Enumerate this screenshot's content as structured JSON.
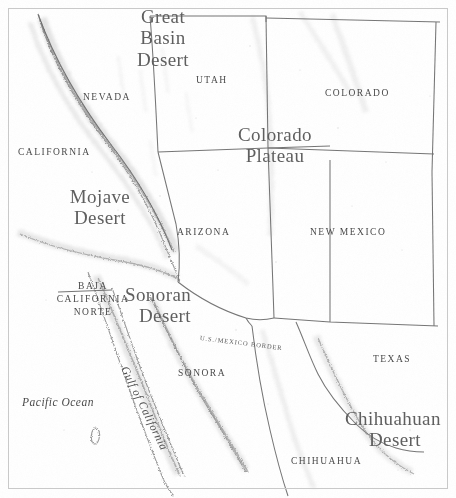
{
  "map": {
    "title": "Deserts of the North American Southwest",
    "style": "pencil-shaded relief map",
    "frame_color": "#c9c9c9",
    "ink_color": "#4a4a4a",
    "background_color": "#fefefe",
    "width": 456,
    "height": 498
  },
  "regions": [
    {
      "id": "great-basin-desert",
      "name": "Great Basin Desert",
      "lines": [
        "Great",
        "Basin",
        "Desert"
      ]
    },
    {
      "id": "colorado-plateau",
      "name": "Colorado Plateau",
      "lines": [
        "Colorado",
        "Plateau"
      ]
    },
    {
      "id": "mojave-desert",
      "name": "Mojave Desert",
      "lines": [
        "Mojave",
        "Desert"
      ]
    },
    {
      "id": "sonoran-desert",
      "name": "Sonoran Desert",
      "lines": [
        "Sonoran",
        "Desert"
      ]
    },
    {
      "id": "chihuahuan-desert",
      "name": "Chihuahuan Desert",
      "lines": [
        "Chihuahuan",
        "Desert"
      ]
    }
  ],
  "states": [
    {
      "id": "nevada",
      "name": "NEVADA"
    },
    {
      "id": "utah",
      "name": "UTAH"
    },
    {
      "id": "colorado",
      "name": "COLORADO"
    },
    {
      "id": "california",
      "name": "CALIFORNIA"
    },
    {
      "id": "arizona",
      "name": "ARIZONA"
    },
    {
      "id": "new-mexico",
      "name": "NEW MEXICO"
    },
    {
      "id": "texas",
      "name": "TEXAS"
    },
    {
      "id": "baja-california-norte",
      "name": "BAJA CALIFORNIA NORTE",
      "lines": [
        "BAJA",
        "CALIFORNIA",
        "NORTE"
      ]
    },
    {
      "id": "sonora",
      "name": "SONORA"
    },
    {
      "id": "chihuahua",
      "name": "CHIHUAHUA"
    }
  ],
  "water": [
    {
      "id": "pacific-ocean",
      "name": "Pacific Ocean"
    },
    {
      "id": "gulf-of-california",
      "name": "Gulf of California"
    }
  ],
  "annotations": [
    {
      "id": "us-mexico-border",
      "name": "U.S./MEXICO BORDER"
    }
  ]
}
